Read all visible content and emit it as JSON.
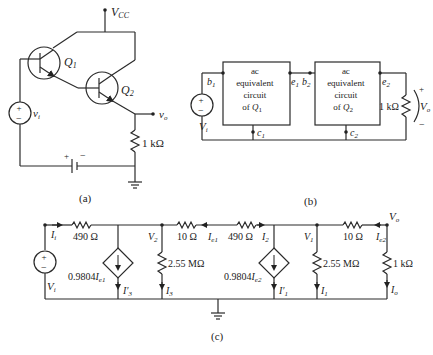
{
  "figure_a": {
    "caption": "(a)",
    "vcc_label": "V",
    "vcc_sub": "CC",
    "q1_label": "Q",
    "q1_sub": "1",
    "q2_label": "Q",
    "q2_sub": "2",
    "source_label": "v",
    "source_sub": "i",
    "output_label": "v",
    "output_sub": "o",
    "resistor_label": "1 kΩ",
    "battery_plus": "+",
    "battery_minus": "−",
    "source_plus": "+",
    "source_minus": "−"
  },
  "figure_b": {
    "caption": "(b)",
    "box1_lines": [
      "ac",
      "equivalent",
      "circuit",
      "of "
    ],
    "box1_q": "Q",
    "box1_qsub": "1",
    "box2_lines": [
      "ac",
      "equivalent",
      "circuit",
      "of "
    ],
    "box2_q": "Q",
    "box2_qsub": "2",
    "node_b1": "b",
    "node_b1_sub": "1",
    "node_e1": "e",
    "node_e1_sub": "1",
    "node_b2": "b",
    "node_b2_sub": "2",
    "node_e2": "e",
    "node_e2_sub": "2",
    "node_c1": "c",
    "node_c1_sub": "1",
    "node_c2": "c",
    "node_c2_sub": "2",
    "source_label": "V",
    "source_sub": "i",
    "load_label": "1 kΩ",
    "output_label": "V",
    "output_sub": "o",
    "output_plus": "+",
    "output_minus": "−"
  },
  "figure_c": {
    "caption": "(c)",
    "source_label": "V",
    "source_sub": "i",
    "current_in": "I",
    "current_in_sub": "i",
    "r1": "490 Ω",
    "r2": "10 Ω",
    "r3": "490 Ω",
    "r4": "10 Ω",
    "rshunt1": "2.55 MΩ",
    "rshunt2": "2.55 MΩ",
    "rload": "1 kΩ",
    "cs1_gain": "0.9804",
    "cs1_ctrl": "I",
    "cs1_ctrl_sub": "e1",
    "cs2_gain": "0.9804",
    "cs2_ctrl": "I",
    "cs2_ctrl_sub": "e2",
    "node_v2": "V",
    "node_v2_sub": "2",
    "node_v1": "V",
    "node_v1_sub": "1",
    "node_vo": "V",
    "node_vo_sub": "o",
    "i_e1": "I",
    "i_e1_sub": "e1",
    "i_e2": "I",
    "i_e2_sub": "e2",
    "i_2": "I",
    "i_2_sub": "2",
    "i3p": "I′",
    "i3p_sub": "3",
    "i3": "I",
    "i3_sub": "3",
    "i1p": "I′",
    "i1p_sub": "1",
    "i1": "I",
    "i1_sub": "1",
    "io": "I",
    "io_sub": "o"
  }
}
